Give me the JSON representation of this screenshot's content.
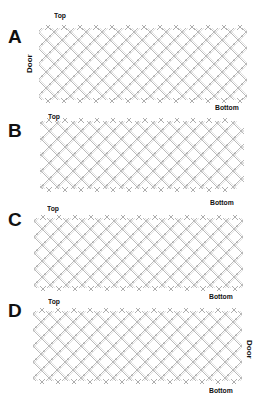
{
  "figure": {
    "panels": [
      {
        "id": "A",
        "label": "A",
        "top_label": "Top",
        "bottom_label": "Bottom",
        "door_label": "Door",
        "door_side": "left"
      },
      {
        "id": "B",
        "label": "B",
        "top_label": "Top",
        "bottom_label": "Bottom"
      },
      {
        "id": "C",
        "label": "C",
        "top_label": "Top",
        "bottom_label": "Bottom"
      },
      {
        "id": "D",
        "label": "D",
        "top_label": "Top",
        "bottom_label": "Bottom",
        "door_label": "Door",
        "door_side": "right"
      }
    ],
    "colors": {
      "lattice_line": "#8a8a8a",
      "lattice_light": "#c4c4c4",
      "text": "#111111",
      "background": "#ffffff"
    }
  }
}
